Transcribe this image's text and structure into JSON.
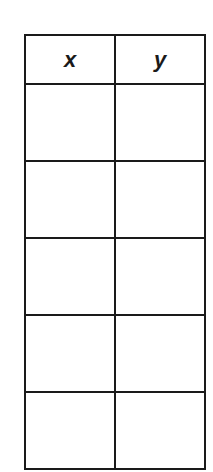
{
  "table": {
    "headers": [
      "x",
      "y"
    ],
    "rows": [
      [
        "",
        ""
      ],
      [
        "",
        ""
      ],
      [
        "",
        ""
      ],
      [
        "",
        ""
      ],
      [
        "",
        ""
      ]
    ]
  },
  "colors": {
    "border": "#1a1a1a",
    "background": "#ffffff"
  }
}
